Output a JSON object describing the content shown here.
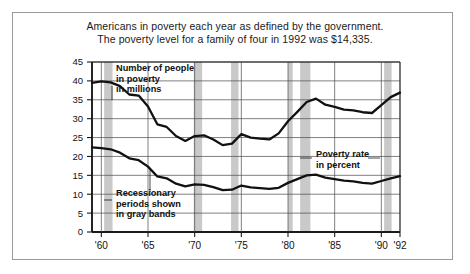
{
  "figure": {
    "title_line1": "Americans in poverty each year as defined by the government.",
    "title_line2": "The poverty level for a family of four in 1992 was $14,335.",
    "frame_color": "#9a9a9a",
    "background": "#ffffff"
  },
  "annotations": {
    "series1": {
      "line1": "Number of people",
      "line2": "in poverty",
      "line3": "in millions"
    },
    "series2": {
      "line1": "Poverty rate",
      "line2": "in percent"
    },
    "bands": {
      "line1": "Recessionary",
      "line2": "periods shown",
      "line3": "in gray bands"
    }
  },
  "chart_data": {
    "type": "line",
    "title": "Americans in poverty each year as defined by the government. The poverty level for a family of four in 1992 was $14,335.",
    "xlabel": "",
    "ylabel": "",
    "xlim": [
      1959,
      1992
    ],
    "ylim": [
      0,
      45
    ],
    "ytick_step": 5,
    "grid": true,
    "legend": "inline-annotations",
    "line_color": "#111111",
    "band_color": "#c9c9c9",
    "ytick_labels": [
      "0",
      "5",
      "10",
      "15",
      "20",
      "25",
      "30",
      "35",
      "40",
      "45"
    ],
    "ytick_values": [
      0,
      5,
      10,
      15,
      20,
      25,
      30,
      35,
      40,
      45
    ],
    "xtick_labels": [
      "'60",
      "'65",
      "'70",
      "'75",
      "'80",
      "'85",
      "'90",
      "'92"
    ],
    "xtick_values": [
      1960,
      1965,
      1970,
      1975,
      1980,
      1985,
      1990,
      1992
    ],
    "x": [
      1959,
      1960,
      1961,
      1962,
      1963,
      1964,
      1965,
      1966,
      1967,
      1968,
      1969,
      1970,
      1971,
      1972,
      1973,
      1974,
      1975,
      1976,
      1977,
      1978,
      1979,
      1980,
      1981,
      1982,
      1983,
      1984,
      1985,
      1986,
      1987,
      1988,
      1989,
      1990,
      1991,
      1992
    ],
    "series": [
      {
        "name": "Number of people in poverty in millions",
        "units": "millions",
        "values": [
          39.5,
          39.9,
          39.6,
          38.6,
          36.4,
          36.1,
          33.2,
          28.5,
          27.8,
          25.4,
          24.1,
          25.4,
          25.6,
          24.5,
          23.0,
          23.4,
          25.9,
          25.0,
          24.7,
          24.5,
          26.1,
          29.3,
          31.8,
          34.4,
          35.3,
          33.7,
          33.1,
          32.4,
          32.2,
          31.7,
          31.5,
          33.6,
          35.7,
          36.9
        ]
      },
      {
        "name": "Poverty rate in percent",
        "units": "percent",
        "values": [
          22.4,
          22.2,
          21.9,
          21.0,
          19.5,
          19.0,
          17.3,
          14.7,
          14.2,
          12.8,
          12.1,
          12.6,
          12.5,
          11.9,
          11.1,
          11.2,
          12.3,
          11.8,
          11.6,
          11.4,
          11.7,
          13.0,
          14.0,
          15.0,
          15.2,
          14.4,
          14.0,
          13.6,
          13.4,
          13.0,
          12.8,
          13.5,
          14.2,
          14.8
        ]
      }
    ],
    "bands": [
      {
        "label": "recession 1960-61",
        "start": 1960.3,
        "end": 1961.2
      },
      {
        "label": "recession 1970",
        "start": 1969.9,
        "end": 1970.8
      },
      {
        "label": "recession 1974",
        "start": 1973.9,
        "end": 1974.7
      },
      {
        "label": "recession 1980",
        "start": 1980.0,
        "end": 1980.5
      },
      {
        "label": "recession 1981-82",
        "start": 1981.3,
        "end": 1982.4
      },
      {
        "label": "recession 1990-91",
        "start": 1990.3,
        "end": 1991.1
      }
    ]
  }
}
